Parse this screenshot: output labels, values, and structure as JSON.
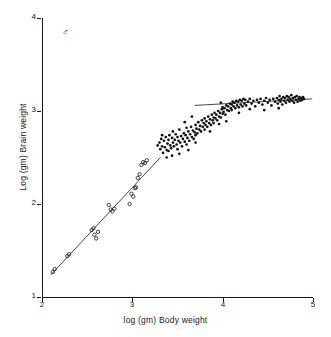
{
  "chart_data": {
    "type": "scatter",
    "title": "",
    "xlabel": "log (gm) Body weight",
    "ylabel": "Log (gm) Brain weight",
    "xlim": [
      2,
      5
    ],
    "ylim": [
      1,
      4
    ],
    "xticks": [
      2,
      3,
      4,
      5
    ],
    "yticks": [
      1,
      2,
      3,
      4
    ],
    "xtick_labels": [
      "2",
      "3",
      "4",
      "5"
    ],
    "ytick_labels": [
      "1",
      "2",
      "3",
      "4"
    ],
    "grid": false,
    "legend": false,
    "annotations": [
      {
        "name": "sex-symbol",
        "text": "♂",
        "x": 2.22,
        "y": 3.78
      }
    ],
    "series": [
      {
        "name": "small-specimens",
        "marker": "open-circle",
        "color": "#1a1a1a",
        "points": [
          [
            2.12,
            1.27
          ],
          [
            2.14,
            1.3
          ],
          [
            2.28,
            1.44
          ],
          [
            2.3,
            1.46
          ],
          [
            2.55,
            1.72
          ],
          [
            2.57,
            1.74
          ],
          [
            2.58,
            1.67
          ],
          [
            2.6,
            1.63
          ],
          [
            2.62,
            1.7
          ],
          [
            2.74,
            1.99
          ],
          [
            2.76,
            1.94
          ],
          [
            2.78,
            1.92
          ],
          [
            2.8,
            1.95
          ],
          [
            2.97,
            2.0
          ],
          [
            2.99,
            2.11
          ],
          [
            3.01,
            2.08
          ],
          [
            3.03,
            2.17
          ],
          [
            3.04,
            2.18
          ],
          [
            3.06,
            2.28
          ],
          [
            3.08,
            2.32
          ],
          [
            3.1,
            2.42
          ],
          [
            3.12,
            2.45
          ],
          [
            3.14,
            2.44
          ],
          [
            3.16,
            2.47
          ]
        ]
      },
      {
        "name": "large-specimens",
        "marker": "filled-dot",
        "color": "#111111",
        "points": [
          [
            3.28,
            2.63
          ],
          [
            3.3,
            2.66
          ],
          [
            3.31,
            2.59
          ],
          [
            3.32,
            2.7
          ],
          [
            3.33,
            2.62
          ],
          [
            3.34,
            2.55
          ],
          [
            3.35,
            2.68
          ],
          [
            3.36,
            2.61
          ],
          [
            3.37,
            2.72
          ],
          [
            3.38,
            2.58
          ],
          [
            3.39,
            2.65
          ],
          [
            3.4,
            2.69
          ],
          [
            3.4,
            2.57
          ],
          [
            3.41,
            2.74
          ],
          [
            3.42,
            2.63
          ],
          [
            3.43,
            2.6
          ],
          [
            3.44,
            2.71
          ],
          [
            3.45,
            2.66
          ],
          [
            3.45,
            2.78
          ],
          [
            3.46,
            2.62
          ],
          [
            3.47,
            2.69
          ],
          [
            3.48,
            2.75
          ],
          [
            3.49,
            2.64
          ],
          [
            3.5,
            2.72
          ],
          [
            3.5,
            2.59
          ],
          [
            3.51,
            2.68
          ],
          [
            3.52,
            2.8
          ],
          [
            3.53,
            2.66
          ],
          [
            3.54,
            2.73
          ],
          [
            3.55,
            2.62
          ],
          [
            3.56,
            2.7
          ],
          [
            3.57,
            2.76
          ],
          [
            3.58,
            2.67
          ],
          [
            3.59,
            2.74
          ],
          [
            3.6,
            2.64
          ],
          [
            3.6,
            2.82
          ],
          [
            3.61,
            2.71
          ],
          [
            3.62,
            2.78
          ],
          [
            3.63,
            2.68
          ],
          [
            3.64,
            2.75
          ],
          [
            3.65,
            2.83
          ],
          [
            3.66,
            2.72
          ],
          [
            3.67,
            2.79
          ],
          [
            3.68,
            2.7
          ],
          [
            3.69,
            2.77
          ],
          [
            3.7,
            2.85
          ],
          [
            3.7,
            2.74
          ],
          [
            3.71,
            2.81
          ],
          [
            3.72,
            2.76
          ],
          [
            3.73,
            2.88
          ],
          [
            3.74,
            2.8
          ],
          [
            3.75,
            2.84
          ],
          [
            3.76,
            2.78
          ],
          [
            3.77,
            2.9
          ],
          [
            3.78,
            2.83
          ],
          [
            3.79,
            2.87
          ],
          [
            3.8,
            2.8
          ],
          [
            3.8,
            2.92
          ],
          [
            3.81,
            2.85
          ],
          [
            3.82,
            2.89
          ],
          [
            3.83,
            2.83
          ],
          [
            3.84,
            2.94
          ],
          [
            3.85,
            2.87
          ],
          [
            3.86,
            2.91
          ],
          [
            3.87,
            2.85
          ],
          [
            3.88,
            2.96
          ],
          [
            3.89,
            2.9
          ],
          [
            3.9,
            2.93
          ],
          [
            3.9,
            2.87
          ],
          [
            3.91,
            2.98
          ],
          [
            3.92,
            2.92
          ],
          [
            3.93,
            2.96
          ],
          [
            3.94,
            2.9
          ],
          [
            3.95,
            3.0
          ],
          [
            3.96,
            2.94
          ],
          [
            3.97,
            2.98
          ],
          [
            3.98,
            2.93
          ],
          [
            3.99,
            3.02
          ],
          [
            4.0,
            2.97
          ],
          [
            4.0,
            3.04
          ],
          [
            4.01,
            2.99
          ],
          [
            4.02,
            3.03
          ],
          [
            4.03,
            2.96
          ],
          [
            4.04,
            3.06
          ],
          [
            4.05,
            3.01
          ],
          [
            4.06,
            3.05
          ],
          [
            4.07,
            3.0
          ],
          [
            4.08,
            3.08
          ],
          [
            4.09,
            3.03
          ],
          [
            4.1,
            3.07
          ],
          [
            4.1,
            3.01
          ],
          [
            4.11,
            3.1
          ],
          [
            4.12,
            3.05
          ],
          [
            4.13,
            3.09
          ],
          [
            4.14,
            3.03
          ],
          [
            4.15,
            3.11
          ],
          [
            4.16,
            3.06
          ],
          [
            4.17,
            3.1
          ],
          [
            4.18,
            3.04
          ],
          [
            4.19,
            3.12
          ],
          [
            4.2,
            3.07
          ],
          [
            4.21,
            3.11
          ],
          [
            4.22,
            3.05
          ],
          [
            4.23,
            3.13
          ],
          [
            4.24,
            3.08
          ],
          [
            4.25,
            3.12
          ],
          [
            4.26,
            3.06
          ],
          [
            4.28,
            3.1
          ],
          [
            4.3,
            3.13
          ],
          [
            4.32,
            3.08
          ],
          [
            4.34,
            3.11
          ],
          [
            4.36,
            3.05
          ],
          [
            4.38,
            3.12
          ],
          [
            4.4,
            3.09
          ],
          [
            4.42,
            3.13
          ],
          [
            4.44,
            3.07
          ],
          [
            4.46,
            3.11
          ],
          [
            4.48,
            3.14
          ],
          [
            4.5,
            3.09
          ],
          [
            4.52,
            3.12
          ],
          [
            4.54,
            3.06
          ],
          [
            4.56,
            3.13
          ],
          [
            4.58,
            3.1
          ],
          [
            4.6,
            3.14
          ],
          [
            4.61,
            3.08
          ],
          [
            4.62,
            3.12
          ],
          [
            4.63,
            3.16
          ],
          [
            4.64,
            3.1
          ],
          [
            4.65,
            3.13
          ],
          [
            4.66,
            3.07
          ],
          [
            4.67,
            3.15
          ],
          [
            4.68,
            3.11
          ],
          [
            4.69,
            3.14
          ],
          [
            4.7,
            3.09
          ],
          [
            4.71,
            3.16
          ],
          [
            4.72,
            3.12
          ],
          [
            4.73,
            3.15
          ],
          [
            4.74,
            3.1
          ],
          [
            4.75,
            3.13
          ],
          [
            4.76,
            3.17
          ],
          [
            4.77,
            3.11
          ],
          [
            4.78,
            3.14
          ],
          [
            4.79,
            3.09
          ],
          [
            4.8,
            3.15
          ],
          [
            4.81,
            3.12
          ],
          [
            4.82,
            3.16
          ],
          [
            4.83,
            3.1
          ],
          [
            4.84,
            3.13
          ],
          [
            4.85,
            3.15
          ],
          [
            4.86,
            3.11
          ],
          [
            4.87,
            3.14
          ],
          [
            4.88,
            3.12
          ],
          [
            4.89,
            3.15
          ],
          [
            4.9,
            3.13
          ],
          [
            3.98,
            3.09
          ],
          [
            4.04,
            2.89
          ],
          [
            4.18,
            2.98
          ],
          [
            4.3,
            3.02
          ],
          [
            4.46,
            3.01
          ],
          [
            4.62,
            3.03
          ],
          [
            3.44,
            2.52
          ],
          [
            3.38,
            2.5
          ],
          [
            3.52,
            2.54
          ],
          [
            3.33,
            2.74
          ],
          [
            3.62,
            2.58
          ],
          [
            3.58,
            2.88
          ],
          [
            3.7,
            2.66
          ],
          [
            3.86,
            2.78
          ],
          [
            3.96,
            2.86
          ],
          [
            3.66,
            2.94
          ]
        ]
      }
    ],
    "fit_lines": [
      {
        "name": "allometric-slope-line",
        "x0": 2.1,
        "y0": 1.24,
        "x1": 3.31,
        "y1": 2.5,
        "style": "solid"
      },
      {
        "name": "plateau-line",
        "x0": 3.69,
        "y0": 3.06,
        "x1": 4.99,
        "y1": 3.13,
        "style": "solid"
      }
    ]
  },
  "axes": {
    "x_title": "log (gm) Body weight",
    "y_title": "Log (gm) Brain weight",
    "x_tick_labels": [
      "2",
      "3",
      "4",
      "5"
    ],
    "y_tick_labels": [
      "1",
      "2",
      "3",
      "4"
    ]
  },
  "annotation": {
    "sex_symbol": "♂"
  },
  "colors": {
    "axis": "#1a1a1a",
    "marker": "#111111",
    "line": "#333333",
    "background": "#ffffff"
  }
}
